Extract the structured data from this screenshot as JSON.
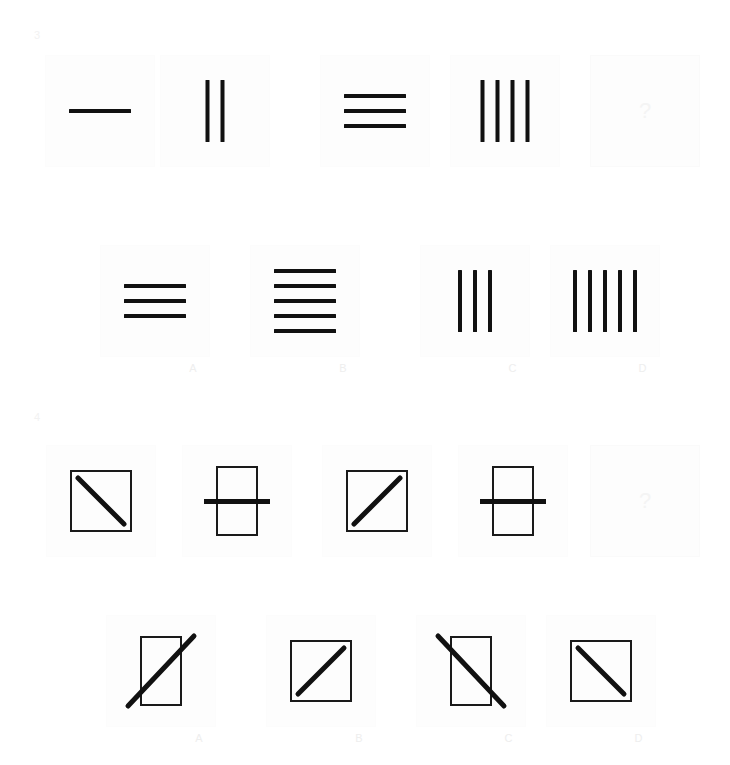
{
  "puzzles": [
    {
      "number": "3",
      "question_row": {
        "cells": [
          {
            "name": "q3-item-1",
            "kind": "lines",
            "orientation": "horizontal",
            "count": 1,
            "description": "one horizontal line"
          },
          {
            "name": "q3-item-2",
            "kind": "lines",
            "orientation": "vertical",
            "count": 2,
            "description": "two vertical lines"
          },
          {
            "name": "q3-item-3",
            "kind": "lines",
            "orientation": "horizontal",
            "count": 3,
            "description": "three horizontal lines"
          },
          {
            "name": "q3-item-4",
            "kind": "lines",
            "orientation": "vertical",
            "count": 4,
            "description": "four vertical lines"
          },
          {
            "name": "q3-item-5",
            "kind": "question",
            "text": "?",
            "description": "missing item"
          }
        ]
      },
      "answer_row": {
        "options": [
          {
            "label": "A",
            "kind": "lines",
            "orientation": "horizontal",
            "count": 3,
            "description": "three horizontal lines"
          },
          {
            "label": "B",
            "kind": "lines",
            "orientation": "horizontal",
            "count": 5,
            "description": "five horizontal lines"
          },
          {
            "label": "C",
            "kind": "lines",
            "orientation": "vertical",
            "count": 3,
            "description": "three vertical lines"
          },
          {
            "label": "D",
            "kind": "lines",
            "orientation": "vertical",
            "count": 5,
            "description": "five vertical lines"
          }
        ]
      }
    },
    {
      "number": "4",
      "question_row": {
        "cells": [
          {
            "name": "q4-item-1",
            "kind": "box",
            "shape": "square",
            "mark": "backslash",
            "overhang": false,
            "description": "square with backslash diagonal inside"
          },
          {
            "name": "q4-item-2",
            "kind": "box",
            "shape": "tall",
            "mark": "crossbar",
            "overhang": true,
            "description": "tall rectangle crossed by horizontal bar"
          },
          {
            "name": "q4-item-3",
            "kind": "box",
            "shape": "square",
            "mark": "slash",
            "overhang": false,
            "description": "square with forward slash diagonal inside"
          },
          {
            "name": "q4-item-4",
            "kind": "box",
            "shape": "tall",
            "mark": "crossbar",
            "overhang": true,
            "description": "tall rectangle crossed by horizontal bar"
          },
          {
            "name": "q4-item-5",
            "kind": "question",
            "text": "?",
            "description": "missing item"
          }
        ]
      },
      "answer_row": {
        "options": [
          {
            "label": "A",
            "kind": "box",
            "shape": "tall",
            "mark": "slash",
            "overhang": true,
            "description": "tall rectangle with forward slash extending past corners"
          },
          {
            "label": "B",
            "kind": "box",
            "shape": "square",
            "mark": "slash",
            "overhang": false,
            "description": "square with forward slash inside"
          },
          {
            "label": "C",
            "kind": "box",
            "shape": "tall",
            "mark": "backslash",
            "overhang": true,
            "description": "tall rectangle with backslash extending past corners"
          },
          {
            "label": "D",
            "kind": "box",
            "shape": "square",
            "mark": "backslash",
            "overhang": false,
            "description": "square with backslash inside"
          }
        ]
      }
    }
  ],
  "colors": {
    "background": "#ffffff",
    "stroke": "#111111",
    "panel_background": "#fdfdfd",
    "panel_border": "#fafafa",
    "label_text": "#eeeeee",
    "question_mark": "#f4f4f4"
  }
}
